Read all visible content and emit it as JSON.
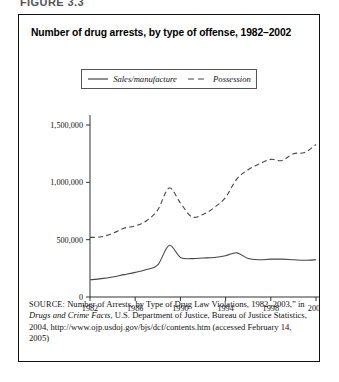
{
  "figure_label": "FIGURE 3.3",
  "figure": {
    "title": "Number of drug arrests, by type of offense, 1982–2002",
    "source_prefix": "SOURCE:",
    "source_part1": " Number of Arrests, by Type of Drug Law Violations, 1982–2003,” in ",
    "source_italic": "Drugs and Crime Facts",
    "source_part2": ", U.S. Department of Justice, Bureau of Justice Statistics, 2004, http://www.ojp.usdoj.gov/bjs/dcf/contents.htm (accessed February 14, 2005)"
  },
  "legend": {
    "items": [
      {
        "label": "Sales/manufacture",
        "style": "solid",
        "color": "#444444"
      },
      {
        "label": "Possession",
        "style": "dashed",
        "color": "#444444"
      }
    ]
  },
  "axes": {
    "y_ticks": [
      "0",
      "500,000",
      "1,000,000",
      "1,500,000"
    ],
    "x_ticks": [
      "1982",
      "1986",
      "1990",
      "1994",
      "1998",
      "2002"
    ]
  },
  "chart_data": {
    "type": "line",
    "title": "Number of drug arrests, by type of offense, 1982–2002",
    "xlabel": "",
    "ylabel": "",
    "xlim": [
      1982,
      2002
    ],
    "ylim": [
      0,
      1500000
    ],
    "grid": false,
    "legend_position": "top-center",
    "y_tick_values": [
      0,
      500000,
      1000000,
      1500000
    ],
    "x_tick_values": [
      1982,
      1986,
      1990,
      1994,
      1998,
      2002
    ],
    "x": [
      1982,
      1983,
      1984,
      1985,
      1986,
      1987,
      1988,
      1989,
      1990,
      1991,
      1992,
      1993,
      1994,
      1995,
      1996,
      1997,
      1998,
      1999,
      2000,
      2001,
      2002
    ],
    "series": [
      {
        "name": "Sales/manufacture",
        "style": "solid",
        "color": "#444444",
        "values": [
          150000,
          160000,
          175000,
          195000,
          215000,
          240000,
          280000,
          450000,
          345000,
          335000,
          340000,
          345000,
          360000,
          385000,
          335000,
          325000,
          330000,
          330000,
          325000,
          320000,
          325000
        ]
      },
      {
        "name": "Possession",
        "style": "dashed",
        "color": "#444444",
        "values": [
          520000,
          525000,
          555000,
          600000,
          620000,
          665000,
          760000,
          950000,
          820000,
          700000,
          720000,
          780000,
          870000,
          1030000,
          1110000,
          1160000,
          1200000,
          1190000,
          1250000,
          1260000,
          1330000
        ]
      }
    ]
  }
}
